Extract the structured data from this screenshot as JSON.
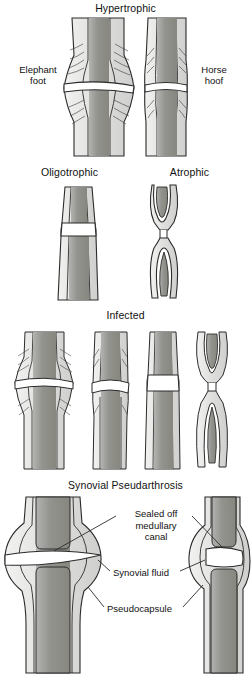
{
  "figure": {
    "title_implicit": "Nonunion classification diagram",
    "background_color": "#ffffff",
    "line_color": "#2b2b2b",
    "cortex_fill": "#e3e3e1",
    "medulla_fill": "#9a9a98",
    "gap_fill": "#ffffff",
    "text_color": "#111111"
  },
  "panels": [
    {
      "id": "hypertrophic",
      "title": "Hypertrophic",
      "side_labels": [
        {
          "id": "elephant-foot",
          "text": "Elephant\nfoot",
          "side": "left"
        },
        {
          "id": "horse-hoof",
          "text": "Horse\nhoof",
          "side": "right"
        }
      ],
      "figures": [
        "elephant-foot-bone",
        "horse-hoof-bone"
      ]
    },
    {
      "id": "oligotrophic-atrophic",
      "titles": [
        {
          "id": "oligotrophic",
          "text": "Oligotrophic"
        },
        {
          "id": "atrophic",
          "text": "Atrophic"
        }
      ],
      "figures": [
        "oligotrophic-bone",
        "atrophic-bone"
      ]
    },
    {
      "id": "infected",
      "title": "Infected",
      "figures": [
        "infected-hypertrophic-bone",
        "infected-oblique-bone",
        "infected-oligotrophic-bone",
        "infected-atrophic-bone"
      ]
    },
    {
      "id": "synovial-pseudarthrosis",
      "title": "Synovial Pseudarthrosis",
      "callouts": [
        {
          "id": "sealed-off-medullary-canal",
          "text": "Sealed off\nmedullary\ncanal"
        },
        {
          "id": "synovial-fluid",
          "text": "Synovial fluid"
        },
        {
          "id": "pseudocapsule",
          "text": "Pseudocapsule"
        }
      ],
      "figures": [
        "synovial-joint-large",
        "synovial-joint-small"
      ]
    }
  ]
}
